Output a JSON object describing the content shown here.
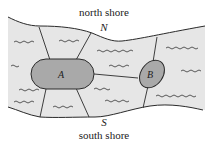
{
  "labels": {
    "north_shore": "north shore",
    "south_shore": "south shore",
    "north_node": "N",
    "south_node": "S",
    "island_a": "A",
    "island_b": "B"
  },
  "colors": {
    "river": "#e6e6e6",
    "island": "#a9a9a9",
    "line": "#2a2a2a",
    "water_wave": "#333333"
  }
}
